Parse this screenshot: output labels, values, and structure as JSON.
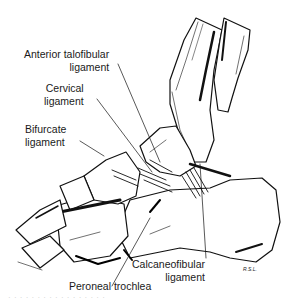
{
  "figure": {
    "ink_color": "#111111",
    "background": "#ffffff"
  },
  "labels": {
    "anterior_talofibular": {
      "line1": "Anterior talofibular",
      "line2": "ligament"
    },
    "cervical": {
      "line1": "Cervical",
      "line2": "ligament"
    },
    "bifurcate": {
      "line1": "Bifurcate",
      "line2": "ligament"
    },
    "calcaneofibular": {
      "line1": "Calcaneofibular",
      "line2": "ligament"
    },
    "peroneal_trochlea": {
      "line1": "Peroneal trochlea"
    }
  },
  "signature": "R.S.L.",
  "caption_fragment": "· · ·  · · ·  · · · ·  · · · ·  · · ·"
}
